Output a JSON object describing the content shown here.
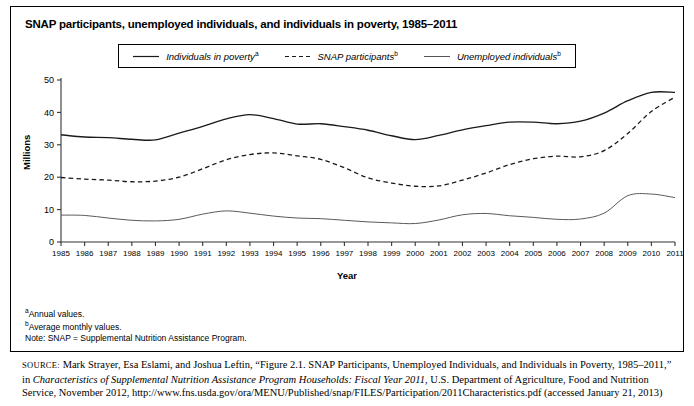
{
  "figure": {
    "title": "SNAP participants, unemployed individuals, and individuals in poverty, 1985–2011",
    "ylabel": "Millions",
    "xlabel": "Year"
  },
  "legend": {
    "items": [
      {
        "label": "Individuals in poverty",
        "superscript": "a",
        "style": "solid",
        "color": "#1a1a1a"
      },
      {
        "label": "SNAP participants",
        "superscript": "b",
        "style": "dashed",
        "color": "#1a1a1a"
      },
      {
        "label": "Unemployed individuals",
        "superscript": "b",
        "style": "solid-thin",
        "color": "#555555"
      }
    ]
  },
  "footnotes": {
    "a": "Annual values.",
    "b": "Average monthly values.",
    "note": "Note: SNAP = Supplemental Nutrition Assistance Program."
  },
  "source": {
    "label": "SOURCE:",
    "part1": " Mark Strayer, Esa Eslami, and Joshua Leftin, “Figure 2.1. SNAP Participants, Unemployed Individuals, and Individuals in Poverty, 1985–2011,” in ",
    "italic": "Characteristics of Supplemental Nutrition Assistance Program Households: Fiscal Year 2011",
    "part2": ", U.S. Department of Agriculture, Food and Nutrition Service, November 2012, http://www.fns.usda.gov/ora/MENU/Published/snap/FILES/Participation/2011Characteristics.pdf (accessed January 21, 2013)"
  },
  "chart_data": {
    "type": "line",
    "title": "SNAP participants, unemployed individuals, and individuals in poverty, 1985–2011",
    "xlabel": "Year",
    "ylabel": "Millions",
    "xlim": [
      1985,
      2011
    ],
    "ylim": [
      0,
      50
    ],
    "yticks": [
      0,
      10,
      20,
      30,
      40,
      50
    ],
    "grid": false,
    "legend_position": "top-center",
    "categories": [
      1985,
      1986,
      1987,
      1988,
      1989,
      1990,
      1991,
      1992,
      1993,
      1994,
      1995,
      1996,
      1997,
      1998,
      1999,
      2000,
      2001,
      2002,
      2003,
      2004,
      2005,
      2006,
      2007,
      2008,
      2009,
      2010,
      2011
    ],
    "series": [
      {
        "name": "Individuals in poverty",
        "superscript": "a",
        "style": "solid",
        "values": [
          33.1,
          32.4,
          32.2,
          31.7,
          31.5,
          33.6,
          35.7,
          38.0,
          39.3,
          38.1,
          36.4,
          36.5,
          35.6,
          34.5,
          32.8,
          31.6,
          32.9,
          34.6,
          35.9,
          37.0,
          37.0,
          36.5,
          37.3,
          39.8,
          43.6,
          46.2,
          46.2
        ]
      },
      {
        "name": "SNAP participants",
        "superscript": "b",
        "style": "dashed",
        "values": [
          19.9,
          19.4,
          19.1,
          18.6,
          18.8,
          20.0,
          22.6,
          25.4,
          27.0,
          27.5,
          26.6,
          25.5,
          22.9,
          19.8,
          18.2,
          17.2,
          17.3,
          19.1,
          21.3,
          23.9,
          25.7,
          26.5,
          26.3,
          28.2,
          33.5,
          40.3,
          44.7
        ]
      },
      {
        "name": "Unemployed individuals",
        "superscript": "b",
        "style": "solid-thin",
        "values": [
          8.3,
          8.2,
          7.4,
          6.7,
          6.5,
          7.0,
          8.6,
          9.6,
          8.9,
          8.0,
          7.4,
          7.2,
          6.7,
          6.2,
          5.9,
          5.7,
          6.8,
          8.4,
          8.8,
          8.1,
          7.6,
          7.0,
          7.1,
          8.9,
          14.3,
          14.8,
          13.7
        ]
      }
    ]
  }
}
